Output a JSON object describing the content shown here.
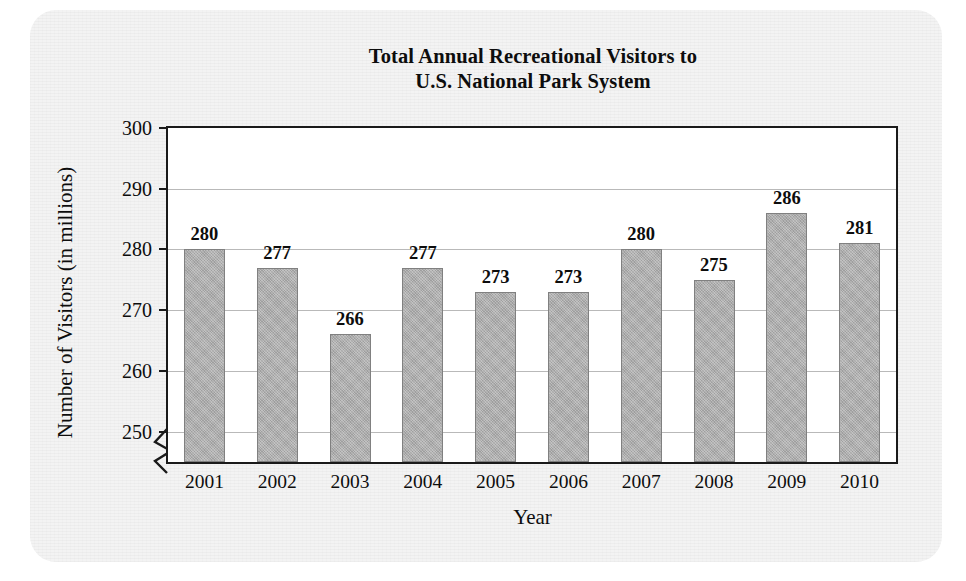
{
  "chart_data": {
    "type": "bar",
    "title": "Total Annual Recreational Visitors to U.S. National Park System",
    "title_line1": "Total Annual Recreational Visitors to",
    "title_line2": "U.S. National Park System",
    "xlabel": "Year",
    "ylabel": "Number of Visitors (in millions)",
    "categories": [
      "2001",
      "2002",
      "2003",
      "2004",
      "2005",
      "2006",
      "2007",
      "2008",
      "2009",
      "2010"
    ],
    "values": [
      280,
      277,
      266,
      277,
      273,
      273,
      280,
      275,
      286,
      281
    ],
    "value_labels": [
      "280",
      "277",
      "266",
      "277",
      "273",
      "273",
      "280",
      "275",
      "286",
      "281"
    ],
    "ylim": [
      245,
      300
    ],
    "yticks": [
      250,
      260,
      270,
      280,
      290,
      300
    ],
    "ytick_labels": [
      "250",
      "260",
      "270",
      "280",
      "290",
      "300"
    ],
    "grid": true,
    "grid_axis": "y",
    "legend": null,
    "axis_break": true,
    "axis_break_note": "y-axis broken below 250",
    "bar_color": "#aeaeae",
    "bar_border_color": "#808080",
    "gridline_color": "#b9b9b9",
    "axis_color": "#1a1a1a",
    "plot_background": "#ffffff",
    "page_background": "#f3f3f3"
  }
}
